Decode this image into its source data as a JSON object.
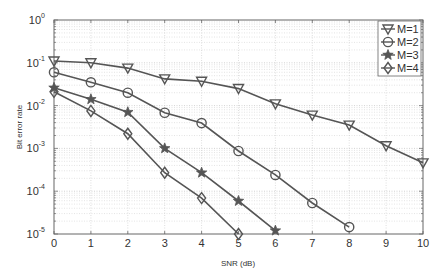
{
  "chart_data": {
    "type": "line",
    "title": "",
    "xlabel": "SNR (dB)",
    "ylabel": "Bit error rate",
    "xscale": "linear",
    "yscale": "log",
    "xlim": [
      0,
      10
    ],
    "ylim": [
      1e-05,
      1
    ],
    "grid": true,
    "legend_position": "upper right",
    "x_ticks": [
      "0",
      "1",
      "2",
      "3",
      "4",
      "5",
      "6",
      "7",
      "8",
      "9",
      "10"
    ],
    "y_ticks": [
      {
        "base": "10",
        "exp": "0"
      },
      {
        "base": "10",
        "exp": "-1"
      },
      {
        "base": "10",
        "exp": "-2"
      },
      {
        "base": "10",
        "exp": "-3"
      },
      {
        "base": "10",
        "exp": "-4"
      },
      {
        "base": "10",
        "exp": "-5"
      }
    ],
    "series": [
      {
        "name": "M=1",
        "marker": "triangle-down",
        "x": [
          0,
          1,
          2,
          3,
          4,
          5,
          6,
          7,
          8,
          9,
          10
        ],
        "values": [
          0.11,
          0.1,
          0.075,
          0.042,
          0.037,
          0.025,
          0.011,
          0.006,
          0.0035,
          0.00115,
          0.00046
        ]
      },
      {
        "name": "M=2",
        "marker": "circle",
        "x": [
          0,
          1,
          2,
          3,
          4,
          5,
          6,
          7,
          8
        ],
        "values": [
          0.06,
          0.035,
          0.02,
          0.0068,
          0.0039,
          0.00087,
          0.00024,
          5.3e-05,
          1.45e-05
        ]
      },
      {
        "name": "M=3",
        "marker": "star",
        "x": [
          0,
          1,
          2,
          3,
          4,
          5,
          6
        ],
        "values": [
          0.026,
          0.014,
          0.007,
          0.001,
          0.00027,
          5.9e-05,
          1.2e-05
        ]
      },
      {
        "name": "M=4",
        "marker": "diamond",
        "x": [
          0,
          1,
          2,
          3,
          4,
          5
        ],
        "values": [
          0.021,
          0.0075,
          0.0022,
          0.00027,
          6.9e-05,
          1e-05
        ]
      }
    ]
  },
  "colors": {
    "line": "#555555",
    "axis": "#666666",
    "grid": "#c8c8c8",
    "background": "#ffffff"
  }
}
